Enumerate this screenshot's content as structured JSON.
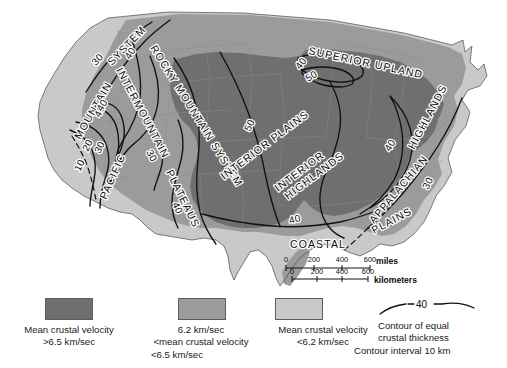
{
  "figure": {
    "kind": "thematic-map"
  },
  "map": {
    "region_labels": [
      {
        "id": "pacific-mountain-system",
        "text": "PACIFIC"
      },
      {
        "id": "pacific-mountain-system-2",
        "text": "MOUNTAIN"
      },
      {
        "id": "pacific-mountain-system-3",
        "text": "SYSTEM"
      },
      {
        "id": "intermountain-plateaus",
        "text": "INTERMOUNTAIN"
      },
      {
        "id": "intermountain-plateaus-2",
        "text": "PLATEAUS"
      },
      {
        "id": "rocky-mountain-system",
        "text": "ROCKY MOUNTAIN SYSTEM"
      },
      {
        "id": "interior-plains",
        "text": "INTERIOR PLAINS"
      },
      {
        "id": "interior-highlands",
        "text": "INTERIOR"
      },
      {
        "id": "interior-highlands-2",
        "text": "HIGHLANDS"
      },
      {
        "id": "superior-upland",
        "text": "SUPERIOR UPLAND"
      },
      {
        "id": "appalachian-highlands",
        "text": "APPALACHIAN"
      },
      {
        "id": "appalachian-highlands-2",
        "text": "HIGHLANDS"
      },
      {
        "id": "coastal-plains",
        "text": "COASTAL"
      },
      {
        "id": "coastal-plains-2",
        "text": "PLAINS"
      }
    ],
    "contour_labels": [
      {
        "id": "c-pac-10",
        "value": "10"
      },
      {
        "id": "c-pac-20",
        "value": "20"
      },
      {
        "id": "c-pac-30",
        "value": "30"
      },
      {
        "id": "c-pac-40",
        "value": "40"
      },
      {
        "id": "c-nw-30",
        "value": "30"
      },
      {
        "id": "c-nw-40",
        "value": "40"
      },
      {
        "id": "c-gb-40",
        "value": "40"
      },
      {
        "id": "c-gb-30",
        "value": "30"
      },
      {
        "id": "c-cp-40",
        "value": "40"
      },
      {
        "id": "c-sup-40",
        "value": "40"
      },
      {
        "id": "c-sup-50",
        "value": "50"
      },
      {
        "id": "c-plains-50",
        "value": "50"
      },
      {
        "id": "c-south-40",
        "value": "40"
      },
      {
        "id": "c-app-40",
        "value": "40"
      },
      {
        "id": "c-app-30",
        "value": "30"
      }
    ],
    "scale_bar": {
      "miles": {
        "ticks": [
          "0",
          "200",
          "400",
          "600"
        ],
        "unit": "miles"
      },
      "kilometers": {
        "ticks": [
          "0",
          "200",
          "400",
          "600"
        ],
        "unit": "kilometers"
      }
    }
  },
  "legend": {
    "items": [
      {
        "id": "velocity-high",
        "color": "#6f6f6f",
        "lines": [
          "Mean crustal velocity",
          ">6.5 km/sec"
        ]
      },
      {
        "id": "velocity-mid",
        "color": "#9b9b9b",
        "lines": [
          "6.2 km/sec",
          "<mean crustal velocity",
          "<6.5 km/sec"
        ]
      },
      {
        "id": "velocity-low",
        "color": "#c9c9c9",
        "lines": [
          "Mean crustal velocity",
          "<6.2 km/sec"
        ]
      },
      {
        "id": "contour-key",
        "sample_value": "40",
        "lines": [
          "Contour of equal",
          "crustal thickness",
          "Contour interval 10 km"
        ]
      }
    ]
  }
}
